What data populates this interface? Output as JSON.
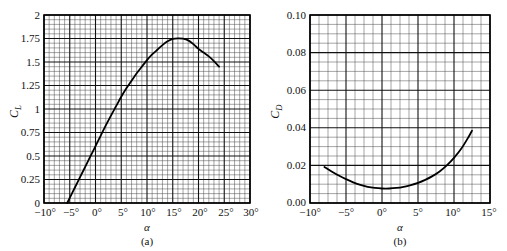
{
  "figure": {
    "panels": [
      {
        "id": "a",
        "caption": "(a)",
        "y_axis_title": "C",
        "y_axis_subscript": "L",
        "x_axis_title": "α",
        "y_ticks": [
          "0",
          "0.25",
          "0.5",
          "0.75",
          "1",
          "1.25",
          "1.5",
          "1.75",
          "2"
        ],
        "x_ticks": [
          "−10°",
          "−5°",
          "0°",
          "5°",
          "10°",
          "15°",
          "20°",
          "25°",
          "30°"
        ]
      },
      {
        "id": "b",
        "caption": "(b)",
        "y_axis_title": "C",
        "y_axis_subscript": "D",
        "x_axis_title": "α",
        "y_ticks": [
          "0.00",
          "0.02",
          "0.04",
          "0.06",
          "0.08",
          "0.10"
        ],
        "x_ticks": [
          "−10°",
          "−5°",
          "0°",
          "5°",
          "10°",
          "15°"
        ]
      }
    ]
  },
  "chart_data": [
    {
      "type": "line",
      "id": "lift-curve",
      "title": "",
      "subtitle": "",
      "xlabel": "α",
      "ylabel": "C_L",
      "xlim": [
        -10,
        30
      ],
      "ylim": [
        0,
        2
      ],
      "xtick_values": [
        -10,
        -5,
        0,
        5,
        10,
        15,
        20,
        25,
        30
      ],
      "ytick_values": [
        0,
        0.25,
        0.5,
        0.75,
        1,
        1.25,
        1.5,
        1.75,
        2
      ],
      "xtick_labels": [
        "−10°",
        "−5°",
        "0°",
        "5°",
        "10°",
        "15°",
        "20°",
        "25°",
        "30°"
      ],
      "ytick_labels": [
        "0",
        "0.25",
        "0.5",
        "0.75",
        "1",
        "1.25",
        "1.5",
        "1.75",
        "2"
      ],
      "grid": true,
      "grid_minor_divisions_x": 5,
      "grid_minor_divisions_y": 5,
      "legend": "none",
      "line_color": "#000000",
      "x": [
        -5.5,
        -5,
        -4,
        -3,
        -2,
        -1,
        0,
        1,
        2,
        3,
        4,
        5,
        6,
        7,
        8,
        9,
        10,
        11,
        12,
        13,
        14,
        15,
        16,
        17,
        18,
        19,
        20,
        21,
        22,
        23,
        24
      ],
      "y": [
        0.0,
        0.055,
        0.165,
        0.275,
        0.385,
        0.495,
        0.605,
        0.715,
        0.825,
        0.93,
        1.03,
        1.13,
        1.22,
        1.3,
        1.38,
        1.45,
        1.52,
        1.58,
        1.63,
        1.68,
        1.72,
        1.745,
        1.752,
        1.748,
        1.73,
        1.69,
        1.64,
        1.6,
        1.56,
        1.51,
        1.45
      ],
      "annotations": {
        "zero_lift_angle_deg": -5.5,
        "max_cl": 1.75,
        "stall_angle_deg": 16,
        "cl_at_24deg": 1.45
      }
    },
    {
      "type": "line",
      "id": "drag-curve",
      "title": "",
      "subtitle": "",
      "xlabel": "α",
      "ylabel": "C_D",
      "xlim": [
        -10,
        15
      ],
      "ylim": [
        0.0,
        0.1
      ],
      "xtick_values": [
        -10,
        -5,
        0,
        5,
        10,
        15
      ],
      "ytick_values": [
        0.0,
        0.02,
        0.04,
        0.06,
        0.08,
        0.1
      ],
      "xtick_labels": [
        "−10°",
        "−5°",
        "0°",
        "5°",
        "10°",
        "15°"
      ],
      "ytick_labels": [
        "0.00",
        "0.02",
        "0.04",
        "0.06",
        "0.08",
        "0.10"
      ],
      "grid": true,
      "grid_minor_divisions_x": 4,
      "grid_minor_divisions_y": 4,
      "legend": "none",
      "line_color": "#000000",
      "x": [
        -8,
        -7,
        -6,
        -5,
        -4,
        -3,
        -2,
        -1,
        0,
        1,
        2,
        3,
        4,
        5,
        6,
        7,
        8,
        9,
        10,
        11,
        12,
        12.5
      ],
      "y": [
        0.0192,
        0.0168,
        0.0146,
        0.0127,
        0.011,
        0.0096,
        0.0086,
        0.008,
        0.0077,
        0.0077,
        0.008,
        0.0086,
        0.0095,
        0.0107,
        0.0123,
        0.0143,
        0.0168,
        0.02,
        0.024,
        0.0288,
        0.035,
        0.0385
      ],
      "annotations": {
        "min_cd": 0.0077,
        "min_cd_angle_deg": 0.5,
        "cd_at_12_5deg": 0.0385
      }
    }
  ]
}
